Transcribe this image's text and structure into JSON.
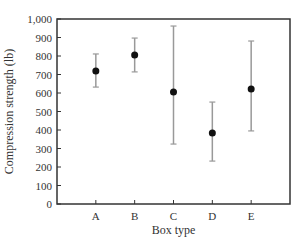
{
  "chart_data": {
    "type": "scatter",
    "subtype": "error-bar",
    "title": "",
    "xlabel": "Box type",
    "ylabel": "Compression strength (lb)",
    "categories": [
      "A",
      "B",
      "C",
      "D",
      "E"
    ],
    "series": [
      {
        "name": "Compression strength",
        "values": [
          719,
          805,
          605,
          384,
          622
        ],
        "upper": [
          811,
          897,
          962,
          551,
          881
        ],
        "lower": [
          632,
          714,
          324,
          232,
          395
        ]
      }
    ],
    "ylim": [
      0,
      1000
    ],
    "yticks": [
      0,
      100,
      200,
      300,
      400,
      500,
      600,
      700,
      800,
      900,
      1000
    ],
    "ytick_labels": [
      "0",
      "100",
      "200",
      "300",
      "400",
      "500",
      "600",
      "700",
      "800",
      "900",
      "1,000"
    ],
    "grid": false,
    "legend": "none",
    "colors": {
      "point": "#111111",
      "errorbar": "#999999",
      "axis": "#333333"
    }
  }
}
